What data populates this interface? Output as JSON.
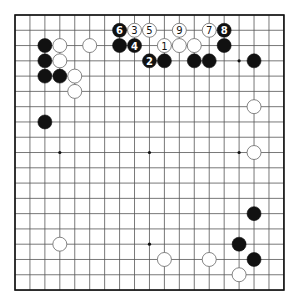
{
  "board": {
    "size": 19,
    "origin_x": 15,
    "origin_y": 15,
    "spacing_x": 14.94,
    "spacing_y": 15.28,
    "stone_radius": 7,
    "colors": {
      "black": "#111111",
      "white": "#ffffff",
      "line": "#555555"
    },
    "star_points": [
      [
        3,
        3
      ],
      [
        9,
        3
      ],
      [
        15,
        3
      ],
      [
        3,
        9
      ],
      [
        9,
        9
      ],
      [
        15,
        9
      ],
      [
        3,
        15
      ],
      [
        9,
        15
      ],
      [
        15,
        15
      ]
    ],
    "stones": [
      {
        "color": "black",
        "col": 2,
        "row": 2
      },
      {
        "color": "white",
        "col": 3,
        "row": 2
      },
      {
        "color": "white",
        "col": 5,
        "row": 2
      },
      {
        "color": "black",
        "col": 2,
        "row": 3
      },
      {
        "color": "white",
        "col": 3,
        "row": 3
      },
      {
        "color": "black",
        "col": 2,
        "row": 4
      },
      {
        "color": "black",
        "col": 3,
        "row": 4
      },
      {
        "color": "white",
        "col": 4,
        "row": 4
      },
      {
        "color": "white",
        "col": 4,
        "row": 5
      },
      {
        "color": "black",
        "col": 2,
        "row": 7
      },
      {
        "color": "black",
        "col": 7,
        "row": 1,
        "label": "6"
      },
      {
        "color": "white",
        "col": 8,
        "row": 1,
        "label": "3"
      },
      {
        "color": "white",
        "col": 9,
        "row": 1,
        "label": "5"
      },
      {
        "color": "white",
        "col": 11,
        "row": 1,
        "label": "9"
      },
      {
        "color": "white",
        "col": 13,
        "row": 1,
        "label": "7"
      },
      {
        "color": "black",
        "col": 14,
        "row": 1,
        "label": "8"
      },
      {
        "color": "black",
        "col": 7,
        "row": 2
      },
      {
        "color": "black",
        "col": 8,
        "row": 2,
        "label": "4"
      },
      {
        "color": "white",
        "col": 10,
        "row": 2,
        "label": "1"
      },
      {
        "color": "white",
        "col": 11,
        "row": 2
      },
      {
        "color": "white",
        "col": 12,
        "row": 2
      },
      {
        "color": "black",
        "col": 14,
        "row": 2
      },
      {
        "color": "black",
        "col": 9,
        "row": 3,
        "label": "2"
      },
      {
        "color": "black",
        "col": 10,
        "row": 3
      },
      {
        "color": "black",
        "col": 12,
        "row": 3
      },
      {
        "color": "black",
        "col": 13,
        "row": 3
      },
      {
        "color": "black",
        "col": 16,
        "row": 3
      },
      {
        "color": "white",
        "col": 16,
        "row": 6
      },
      {
        "color": "white",
        "col": 16,
        "row": 9
      },
      {
        "color": "black",
        "col": 16,
        "row": 13
      },
      {
        "color": "white",
        "col": 3,
        "row": 15
      },
      {
        "color": "black",
        "col": 15,
        "row": 15
      },
      {
        "color": "white",
        "col": 10,
        "row": 16
      },
      {
        "color": "white",
        "col": 13,
        "row": 16
      },
      {
        "color": "black",
        "col": 16,
        "row": 16
      },
      {
        "color": "white",
        "col": 15,
        "row": 17
      }
    ]
  }
}
